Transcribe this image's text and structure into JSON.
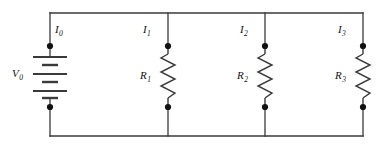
{
  "figure": {
    "kind": "circuit-diagram",
    "background_color": "#ffffff",
    "line_color": "#3a3a3a",
    "node_color": "#111111",
    "text_color": "#111111"
  },
  "source": {
    "symbol": "battery",
    "label_main": "V",
    "label_sub": "0",
    "current_label_main": "I",
    "current_label_sub": "0"
  },
  "branches": [
    {
      "current_label_main": "I",
      "current_label_sub": "1",
      "resistor_label_main": "R",
      "resistor_label_sub": "1"
    },
    {
      "current_label_main": "I",
      "current_label_sub": "2",
      "resistor_label_main": "R",
      "resistor_label_sub": "2"
    },
    {
      "current_label_main": "I",
      "current_label_sub": "3",
      "resistor_label_main": "R",
      "resistor_label_sub": "3"
    }
  ]
}
